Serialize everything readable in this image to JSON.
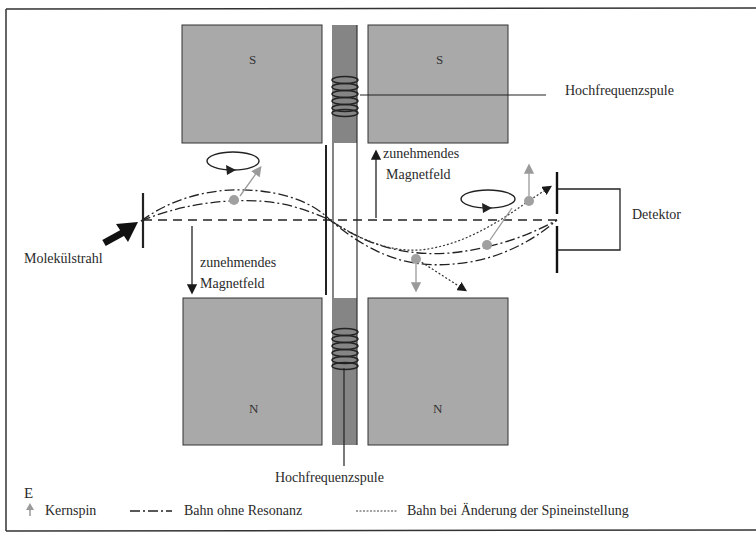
{
  "figure": {
    "panel_letter": "E",
    "labels": {
      "rf_coil_top": "Hochfrequenzspule",
      "rf_coil_bottom": "Hochfrequenzspule",
      "field_up": [
        "zunehmendes",
        "Magnetfeld"
      ],
      "field_down": [
        "zunehmendes",
        "Magnetfeld"
      ],
      "detector": "Detektor",
      "molecular_beam": "Molekülstrahl"
    },
    "magnets": {
      "top_left": "S",
      "top_right": "S",
      "bottom_left": "N",
      "bottom_right": "N"
    },
    "colors": {
      "magnet_fill": "#a9a9a9",
      "coil_core_fill": "#858585",
      "spin_arrow": "#9a9a9a",
      "line": "#1a1a1a"
    }
  },
  "legend": {
    "items": [
      {
        "symbol": "gray-up-arrow",
        "label": "Kernspin"
      },
      {
        "symbol": "dash-dot-line",
        "label": "Bahn ohne Resonanz"
      },
      {
        "symbol": "dotted-line",
        "label": "Bahn bei Änderung der Spineinstellung"
      }
    ]
  }
}
